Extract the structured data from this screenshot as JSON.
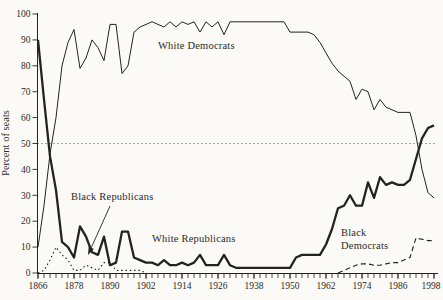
{
  "figure": {
    "background": "#fbfaf7",
    "ink_color": "#262220",
    "text_color": "#2e2a25"
  },
  "labels": {
    "y_axis_title": "Percent of seats",
    "white_democrats": "White Democrats",
    "black_republicans": "Black Republicans",
    "white_republicans": "White Republicans",
    "black_democrats_line1": "Black",
    "black_democrats_line2": "Democrats"
  },
  "chart_data": {
    "type": "line",
    "title": "",
    "xlabel": "",
    "ylabel": "Percent of seats",
    "xlim": [
      1866,
      1998
    ],
    "ylim": [
      0,
      100
    ],
    "grid": false,
    "x_major_ticks": [
      1866,
      1878,
      1890,
      1902,
      1914,
      1926,
      1938,
      1950,
      1962,
      1974,
      1986,
      1998
    ],
    "x_minor_tick_step": 2,
    "y_ticks": [
      0,
      10,
      20,
      30,
      40,
      50,
      60,
      70,
      80,
      90,
      100
    ],
    "reference_line": {
      "value": 50,
      "style": "dotted"
    },
    "series": [
      {
        "name": "White Democrats",
        "style": "solid-thin",
        "x": [
          1866,
          1868,
          1870,
          1872,
          1874,
          1876,
          1878,
          1880,
          1882,
          1884,
          1886,
          1888,
          1890,
          1892,
          1894,
          1896,
          1898,
          1900,
          1902,
          1904,
          1906,
          1908,
          1910,
          1912,
          1914,
          1916,
          1918,
          1920,
          1922,
          1924,
          1926,
          1928,
          1930,
          1932,
          1934,
          1936,
          1938,
          1940,
          1942,
          1944,
          1946,
          1948,
          1950,
          1952,
          1954,
          1956,
          1958,
          1960,
          1962,
          1964,
          1966,
          1968,
          1970,
          1972,
          1974,
          1976,
          1978,
          1980,
          1982,
          1984,
          1986,
          1988,
          1990,
          1992,
          1994,
          1996,
          1998
        ],
        "values": [
          10,
          26,
          46,
          60,
          80,
          89,
          94,
          79,
          83,
          90,
          87,
          82,
          96,
          96,
          77,
          80,
          93,
          95,
          96,
          97,
          96,
          95,
          97,
          95,
          97,
          96,
          97,
          93,
          97,
          95,
          97,
          92,
          97,
          97,
          97,
          97,
          97,
          97,
          97,
          97,
          97,
          97,
          93,
          93,
          93,
          93,
          92,
          89,
          85,
          81,
          78,
          76,
          74,
          67,
          71,
          70,
          63,
          67,
          64,
          63,
          62,
          62,
          62,
          53,
          40,
          31,
          29
        ]
      },
      {
        "name": "White Republicans",
        "style": "solid-thick",
        "x": [
          1866,
          1868,
          1870,
          1872,
          1874,
          1876,
          1878,
          1880,
          1882,
          1884,
          1886,
          1888,
          1890,
          1892,
          1894,
          1896,
          1898,
          1900,
          1902,
          1904,
          1906,
          1908,
          1910,
          1912,
          1914,
          1916,
          1918,
          1920,
          1922,
          1924,
          1926,
          1928,
          1930,
          1932,
          1934,
          1936,
          1938,
          1940,
          1942,
          1944,
          1946,
          1948,
          1950,
          1952,
          1954,
          1956,
          1958,
          1960,
          1962,
          1964,
          1966,
          1968,
          1970,
          1972,
          1974,
          1976,
          1978,
          1980,
          1982,
          1984,
          1986,
          1988,
          1990,
          1992,
          1994,
          1996,
          1998
        ],
        "values": [
          90,
          67,
          45,
          32,
          12,
          10,
          6,
          18,
          14,
          8,
          7,
          14,
          3,
          4,
          16,
          16,
          6,
          5,
          4,
          4,
          3,
          5,
          3,
          3,
          4,
          3,
          4,
          7,
          3,
          3,
          3,
          7,
          3,
          2,
          2,
          2,
          2,
          2,
          2,
          2,
          2,
          2,
          2,
          6,
          7,
          7,
          7,
          7,
          11,
          17,
          25,
          26,
          30,
          26,
          26,
          35,
          29,
          37,
          34,
          35,
          34,
          34,
          36,
          44,
          52,
          56,
          57
        ]
      },
      {
        "name": "Black Republicans",
        "style": "dotted",
        "x": [
          1866,
          1868,
          1870,
          1872,
          1874,
          1876,
          1878,
          1880,
          1882,
          1884,
          1886,
          1888,
          1890,
          1892,
          1894,
          1896,
          1898,
          1900,
          1902
        ],
        "values": [
          0,
          1,
          5,
          10,
          7,
          5,
          1,
          1,
          3,
          2,
          1,
          4,
          4,
          1,
          1,
          1,
          1,
          1,
          0
        ]
      },
      {
        "name": "Black Democrats",
        "style": "dashed",
        "x": [
          1966,
          1968,
          1970,
          1972,
          1974,
          1976,
          1978,
          1980,
          1982,
          1984,
          1986,
          1988,
          1990,
          1992,
          1994,
          1996,
          1998
        ],
        "values": [
          0,
          1,
          2,
          3,
          3.5,
          3.5,
          3,
          3,
          3.5,
          4,
          4,
          5,
          6,
          13.5,
          13,
          12.5,
          12.5
        ]
      }
    ],
    "annotations": [
      {
        "text": "White Democrats",
        "target_series": "White Democrats"
      },
      {
        "text": "Black Republicans",
        "target_series": "Black Republicans",
        "arrow": true
      },
      {
        "text": "White Republicans",
        "target_series": "White Republicans"
      },
      {
        "text": "Black Democrats",
        "target_series": "Black Democrats"
      }
    ]
  }
}
